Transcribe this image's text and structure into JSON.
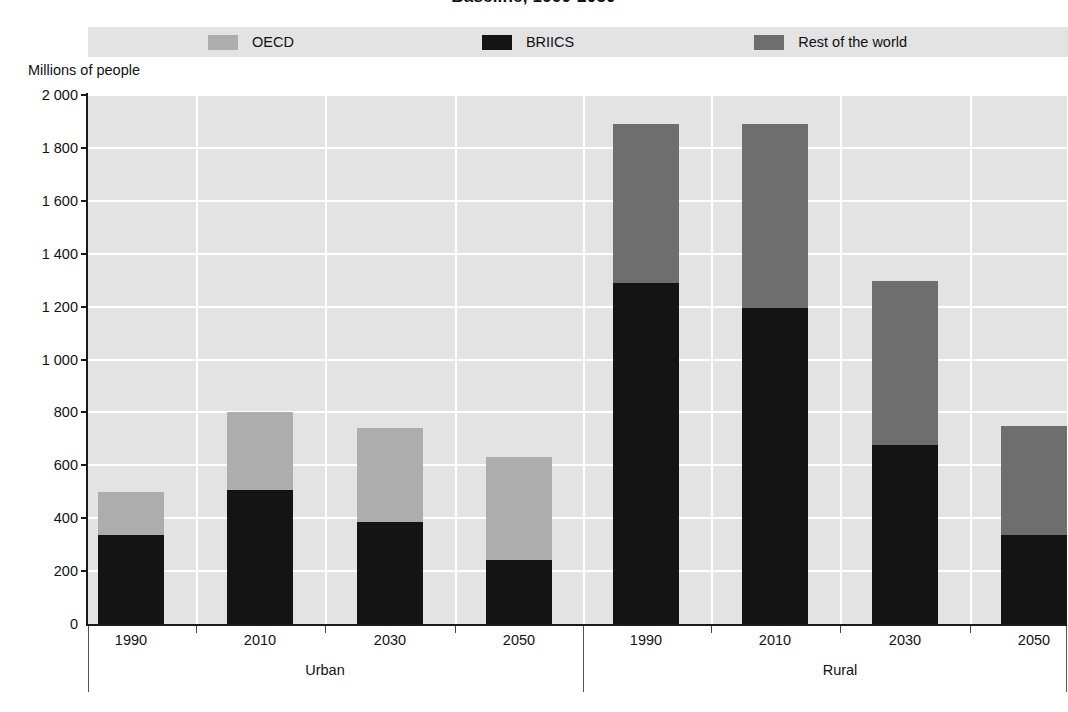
{
  "chart_data": {
    "type": "bar",
    "stacked": true,
    "title": "Baseline, 1990-2050",
    "ylabel": "Millions of people",
    "xlabel": "",
    "ylim": [
      0,
      2000
    ],
    "yticks": [
      0,
      200,
      400,
      600,
      800,
      1000,
      1200,
      1400,
      1600,
      1800,
      2000
    ],
    "ytick_labels": [
      "0",
      "200",
      "400",
      "600",
      "800",
      "1 000",
      "1 200",
      "1 400",
      "1 600",
      "1 800",
      "2 000"
    ],
    "grid": "horizontal-and-vertical-white",
    "legend_position": "top",
    "groups": [
      "Urban",
      "Rural"
    ],
    "categories": [
      "1990",
      "2010",
      "2030",
      "2050",
      "1990",
      "2010",
      "2030",
      "2050"
    ],
    "series": [
      {
        "name": "OECD",
        "color": "#adadad",
        "values": [
          163,
          293,
          355,
          390,
          0,
          0,
          0,
          0
        ]
      },
      {
        "name": "BRIICS",
        "color": "#141414",
        "values": [
          337,
          507,
          386,
          242,
          1290,
          1193,
          677,
          337
        ]
      },
      {
        "name": "Rest of the world",
        "color": "#6e6e6e",
        "values": [
          0,
          0,
          0,
          0,
          600,
          697,
          620,
          413
        ]
      }
    ],
    "totals": [
      500,
      800,
      741,
      632,
      1890,
      1890,
      1297,
      750
    ],
    "panels": [
      {
        "group": "Urban",
        "bars": [
          {
            "category": "1990",
            "briics": 337,
            "oecd": 163,
            "rest_of_world": 0,
            "total": 500
          },
          {
            "category": "2010",
            "briics": 507,
            "oecd": 293,
            "rest_of_world": 0,
            "total": 800
          },
          {
            "category": "2030",
            "briics": 386,
            "oecd": 355,
            "rest_of_world": 0,
            "total": 741
          },
          {
            "category": "2050",
            "briics": 242,
            "oecd": 390,
            "rest_of_world": 0,
            "total": 632
          }
        ]
      },
      {
        "group": "Rural",
        "bars": [
          {
            "category": "1990",
            "briics": 1290,
            "oecd": 0,
            "rest_of_world": 600,
            "total": 1890
          },
          {
            "category": "2010",
            "briics": 1193,
            "oecd": 0,
            "rest_of_world": 697,
            "total": 1890
          },
          {
            "category": "2030",
            "briics": 677,
            "oecd": 0,
            "rest_of_world": 620,
            "total": 1297
          },
          {
            "category": "2050",
            "briics": 337,
            "oecd": 0,
            "rest_of_world": 413,
            "total": 750
          }
        ]
      }
    ]
  },
  "title": "Baseline, 1990-2050",
  "axis": {
    "y_title": "Millions of people"
  },
  "legend": {
    "items": [
      {
        "label": "OECD",
        "color": "#adadad"
      },
      {
        "label": "BRIICS",
        "color": "#141414"
      },
      {
        "label": "Rest of the world",
        "color": "#6e6e6e"
      }
    ]
  },
  "groups": [
    {
      "label": "Urban"
    },
    {
      "label": "Rural"
    }
  ]
}
